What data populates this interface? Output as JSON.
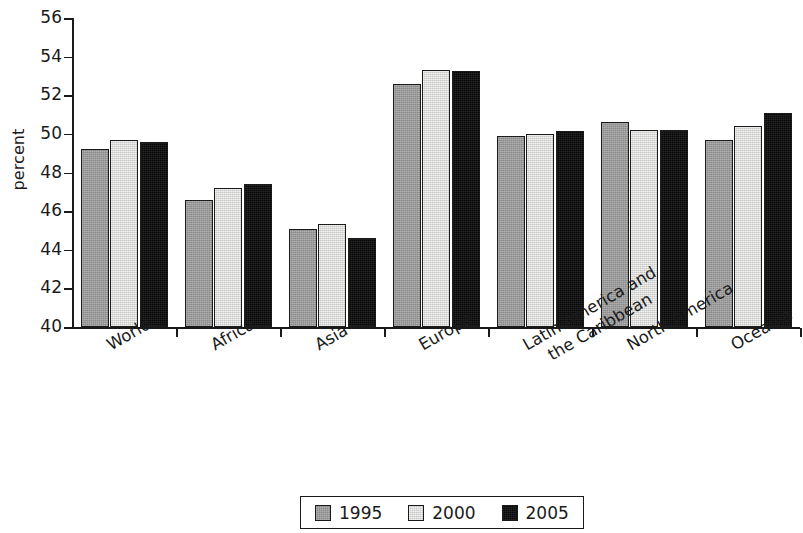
{
  "chart_data": {
    "type": "bar",
    "title": "",
    "xlabel": "",
    "ylabel": "percent",
    "ylim": [
      40,
      56
    ],
    "ytick_step": 2,
    "yticks": [
      56,
      54,
      52,
      50,
      48,
      46,
      44,
      42,
      40
    ],
    "grid": false,
    "legend_position": "bottom-center",
    "categories": [
      "World",
      "Africa",
      "Asia",
      "Europe",
      "Latin America and the Caribbean",
      "North America",
      "Oceania"
    ],
    "category_lines": [
      [
        "World"
      ],
      [
        "Africa"
      ],
      [
        "Asia"
      ],
      [
        "Europe"
      ],
      [
        "Latin America and",
        "the Caribbean"
      ],
      [
        "North America"
      ],
      [
        "Oceania"
      ]
    ],
    "series": [
      {
        "name": "1995",
        "color": "#9c9c9c",
        "values": [
          49.2,
          46.6,
          45.1,
          52.6,
          49.9,
          50.6,
          49.7
        ]
      },
      {
        "name": "2000",
        "color": "#e3e3e1",
        "values": [
          49.7,
          47.2,
          45.35,
          53.3,
          50.0,
          50.2,
          50.4
        ]
      },
      {
        "name": "2005",
        "color": "#0e0e0e",
        "values": [
          49.6,
          47.4,
          44.6,
          53.25,
          50.15,
          50.2,
          51.1
        ]
      }
    ]
  },
  "legend": {
    "items": [
      {
        "label": "1995",
        "swatch_class": "s1995"
      },
      {
        "label": "2000",
        "swatch_class": "s2000"
      },
      {
        "label": "2005",
        "swatch_class": "s2005"
      }
    ]
  }
}
